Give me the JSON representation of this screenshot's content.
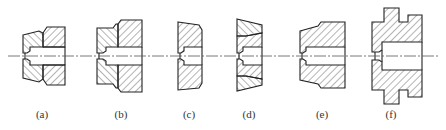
{
  "figure": {
    "line_color": "#222222",
    "hatch_color": "#444444",
    "centerline_color": "#555555",
    "centerline_y": 56,
    "panels": [
      {
        "id": "a",
        "label": "(a)",
        "label_x": 42
      },
      {
        "id": "b",
        "label": "(b)",
        "label_x": 121
      },
      {
        "id": "c",
        "label": "(c)",
        "label_x": 189
      },
      {
        "id": "d",
        "label": "(d)",
        "label_x": 249
      },
      {
        "id": "e",
        "label": "(e)",
        "label_x": 322
      },
      {
        "id": "f",
        "label": "(f)",
        "label_x": 391
      }
    ]
  }
}
